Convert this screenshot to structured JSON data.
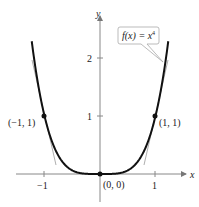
{
  "chart_data": {
    "type": "line",
    "title": "",
    "function_label": "f(x) = x^4",
    "function_label_parts": {
      "lhs": "f(x) = x",
      "exp": "4"
    },
    "xlabel": "x",
    "ylabel": "y",
    "xlim": [
      -1.6,
      1.6
    ],
    "ylim": [
      -0.5,
      2.6
    ],
    "x_ticks": [
      {
        "value": -1,
        "label": "−1"
      },
      {
        "value": 1,
        "label": "1"
      }
    ],
    "y_ticks": [
      {
        "value": 1,
        "label": "1"
      },
      {
        "value": 2,
        "label": "2"
      }
    ],
    "grid": false,
    "series": [
      {
        "name": "f(x) = x^4",
        "x": [
          -1.25,
          -1,
          -0.75,
          -0.5,
          0,
          0.5,
          0.75,
          1,
          1.25
        ],
        "y": [
          2.44,
          1,
          0.316,
          0.0625,
          0,
          0.0625,
          0.316,
          1,
          2.44
        ]
      }
    ],
    "tangent_lines": [
      {
        "point": [
          -1,
          1
        ],
        "slope": -4
      },
      {
        "point": [
          1,
          1
        ],
        "slope": 4
      }
    ],
    "points": [
      {
        "x": -1,
        "y": 1,
        "label": "(−1, 1)"
      },
      {
        "x": 0,
        "y": 0,
        "label": "(0, 0)"
      },
      {
        "x": 1,
        "y": 1,
        "label": "(1, 1)"
      }
    ]
  }
}
